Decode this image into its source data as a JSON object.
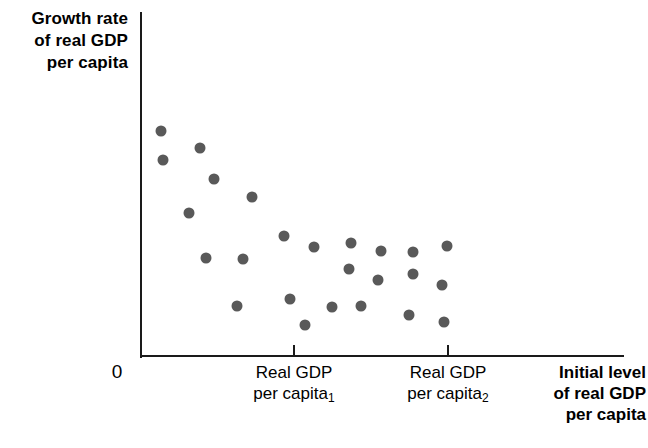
{
  "chart_data": {
    "type": "scatter",
    "title": "",
    "xlabel": "Initial level of real GDP per capita",
    "ylabel": "Growth rate of real GDP per capita",
    "origin_label": "0",
    "grid": false,
    "legend": null,
    "point_color": "#595959",
    "axis_color": "#1a1a1a",
    "xticks": [
      {
        "label_lines": [
          "Real GDP",
          "per capita"
        ],
        "subscript": "1",
        "px": 294
      },
      {
        "label_lines": [
          "Real GDP",
          "per capita"
        ],
        "subscript": "2",
        "px": 448
      }
    ],
    "points": [
      {
        "px": 161,
        "py": 131
      },
      {
        "px": 163,
        "py": 160
      },
      {
        "px": 200,
        "py": 148
      },
      {
        "px": 214,
        "py": 179
      },
      {
        "px": 252,
        "py": 197
      },
      {
        "px": 189,
        "py": 213
      },
      {
        "px": 206,
        "py": 258
      },
      {
        "px": 243,
        "py": 259
      },
      {
        "px": 284,
        "py": 236
      },
      {
        "px": 314,
        "py": 247
      },
      {
        "px": 351,
        "py": 243
      },
      {
        "px": 381,
        "py": 251
      },
      {
        "px": 413,
        "py": 252
      },
      {
        "px": 447,
        "py": 246
      },
      {
        "px": 349,
        "py": 269
      },
      {
        "px": 378,
        "py": 280
      },
      {
        "px": 413,
        "py": 274
      },
      {
        "px": 442,
        "py": 285
      },
      {
        "px": 237,
        "py": 306
      },
      {
        "px": 290,
        "py": 299
      },
      {
        "px": 332,
        "py": 307
      },
      {
        "px": 361,
        "py": 306
      },
      {
        "px": 305,
        "py": 325
      },
      {
        "px": 409,
        "py": 315
      },
      {
        "px": 444,
        "py": 322
      }
    ]
  },
  "axes": {
    "ylabel_lines": [
      "Growth rate",
      "of real GDP",
      "per capita"
    ],
    "origin": "0",
    "xlabel_lines": [
      "Initial level",
      "of real GDP",
      "per capita"
    ]
  },
  "xticks": {
    "t1": {
      "line1": "Real GDP",
      "line2": "per capita",
      "sub": "1"
    },
    "t2": {
      "line1": "Real GDP",
      "line2": "per capita",
      "sub": "2"
    }
  }
}
